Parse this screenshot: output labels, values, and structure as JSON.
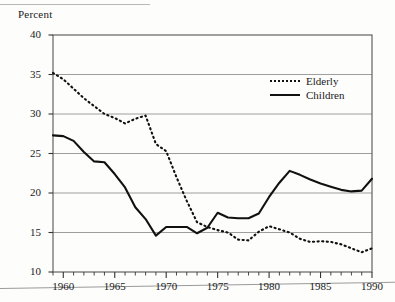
{
  "figure": {
    "y_axis_title": "Percent"
  },
  "legend": {
    "position": "inside-top-right",
    "entries": [
      {
        "label": "Elderly",
        "style": "dotted",
        "swatch_name": "legend-swatch-elderly"
      },
      {
        "label": "Children",
        "style": "solid",
        "swatch_name": "legend-swatch-children"
      }
    ]
  },
  "axes": {
    "y_ticks": [
      "40",
      "35",
      "30",
      "25",
      "20",
      "15",
      "10"
    ],
    "x_ticks": [
      "1960",
      "1965",
      "1970",
      "1975",
      "1980",
      "1985",
      "1990"
    ]
  },
  "chart_data": {
    "type": "line",
    "title": "",
    "subtitle": "",
    "xlabel": "",
    "ylabel": "Percent",
    "xlim": [
      1959,
      1990
    ],
    "ylim": [
      10,
      40
    ],
    "grid": true,
    "grid_axis": "y",
    "legend_position": "inside-top-right",
    "x": [
      1959,
      1960,
      1961,
      1962,
      1963,
      1964,
      1965,
      1966,
      1967,
      1968,
      1969,
      1970,
      1971,
      1972,
      1973,
      1974,
      1975,
      1976,
      1977,
      1978,
      1979,
      1980,
      1981,
      1982,
      1983,
      1984,
      1985,
      1986,
      1987,
      1988,
      1989,
      1990
    ],
    "series": [
      {
        "name": "Elderly",
        "style": "dotted",
        "color": "#111111",
        "values": [
          35.2,
          34.4,
          33.2,
          32.0,
          31.0,
          30.0,
          29.5,
          28.8,
          29.4,
          29.8,
          26.2,
          25.3,
          22.0,
          19.0,
          16.3,
          15.7,
          15.3,
          15.0,
          14.1,
          14.0,
          15.1,
          15.8,
          15.4,
          15.0,
          14.2,
          13.8,
          13.9,
          13.8,
          13.5,
          13.0,
          12.5,
          13.0
        ]
      },
      {
        "name": "Children",
        "style": "solid",
        "color": "#111111",
        "values": [
          27.3,
          27.2,
          26.6,
          25.2,
          24.0,
          23.9,
          22.4,
          20.7,
          18.2,
          16.7,
          14.6,
          15.7,
          15.7,
          15.7,
          14.9,
          15.6,
          17.5,
          16.9,
          16.8,
          16.8,
          17.4,
          19.5,
          21.3,
          22.8,
          22.3,
          21.7,
          21.2,
          20.8,
          20.4,
          20.2,
          20.3,
          21.8
        ]
      }
    ]
  }
}
